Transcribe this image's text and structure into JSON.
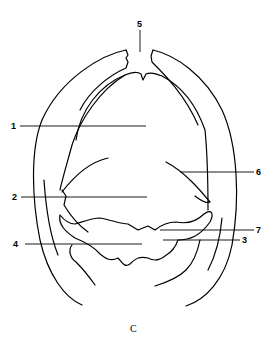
{
  "diagram": {
    "caption": "C",
    "labels": [
      {
        "id": "1",
        "text": "1"
      },
      {
        "id": "2",
        "text": "2"
      },
      {
        "id": "3",
        "text": "3"
      },
      {
        "id": "4",
        "text": "4"
      },
      {
        "id": "5",
        "text": "5"
      },
      {
        "id": "6",
        "text": "6"
      },
      {
        "id": "7",
        "text": "7"
      }
    ]
  }
}
